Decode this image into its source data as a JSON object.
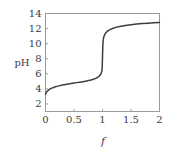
{
  "chart_data": {
    "type": "line",
    "title": "",
    "subtitle": "",
    "xlabel": "f",
    "ylabel": "pH",
    "xlim": [
      0,
      2
    ],
    "ylim": [
      1,
      14
    ],
    "grid": false,
    "legend": null,
    "xticks": [
      0,
      0.5,
      1,
      1.5,
      2
    ],
    "xtick_labels": [
      "0",
      "0.5",
      "1",
      "1.5",
      "2"
    ],
    "yticks": [
      2,
      4,
      6,
      8,
      10,
      12,
      14
    ],
    "ytick_labels": [
      "2",
      "4",
      "6",
      "8",
      "10",
      "12",
      "14"
    ],
    "series": [
      {
        "name": "titration curve",
        "color": "#3d3d3d",
        "x": [
          0.0,
          0.01,
          0.02,
          0.03,
          0.05,
          0.07,
          0.1,
          0.13,
          0.16,
          0.2,
          0.25,
          0.3,
          0.35,
          0.4,
          0.45,
          0.5,
          0.55,
          0.6,
          0.65,
          0.7,
          0.75,
          0.8,
          0.84,
          0.88,
          0.91,
          0.94,
          0.96,
          0.97,
          0.98,
          0.985,
          0.99,
          0.995,
          1.0,
          1.005,
          1.01,
          1.015,
          1.02,
          1.03,
          1.04,
          1.06,
          1.08,
          1.1,
          1.15,
          1.2,
          1.25,
          1.3,
          1.4,
          1.5,
          1.6,
          1.7,
          1.8,
          1.9,
          2.0
        ],
        "y": [
          3.3,
          3.45,
          3.58,
          3.68,
          3.83,
          3.94,
          4.06,
          4.16,
          4.24,
          4.33,
          4.43,
          4.51,
          4.58,
          4.65,
          4.71,
          4.77,
          4.83,
          4.89,
          4.95,
          5.02,
          5.1,
          5.19,
          5.28,
          5.4,
          5.51,
          5.67,
          5.83,
          5.95,
          6.12,
          6.26,
          6.48,
          6.9,
          8.2,
          9.6,
          10.25,
          10.58,
          10.8,
          11.05,
          11.22,
          11.45,
          11.6,
          11.72,
          11.93,
          12.08,
          12.19,
          12.28,
          12.42,
          12.52,
          12.6,
          12.66,
          12.71,
          12.76,
          12.8
        ]
      }
    ]
  },
  "axes": {
    "ylabel_text": "pH",
    "xlabel_text": "f"
  },
  "colors": {
    "curve": "#3d3d3d",
    "frame": "#9a9a9a",
    "text": "#3a3a3a",
    "background": "#ffffff"
  }
}
